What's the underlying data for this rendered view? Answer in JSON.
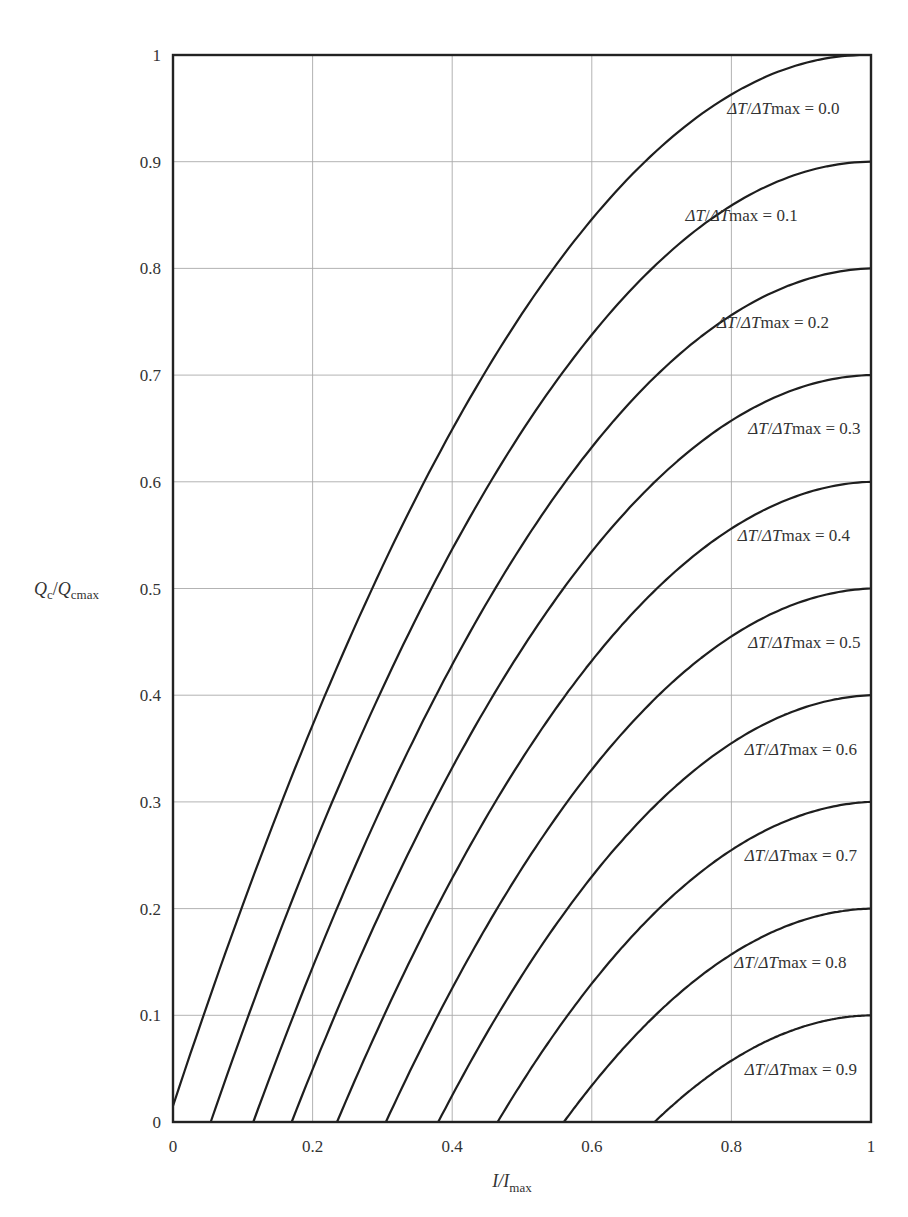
{
  "chart_data": {
    "type": "line",
    "title": "",
    "xlabel": "I/I_max",
    "ylabel": "Q_c/Q_cmax",
    "xlim": [
      0,
      1
    ],
    "ylim": [
      0,
      1
    ],
    "grid": true,
    "legend": "inline labels at right end of each curve",
    "x_ticks": [
      "0",
      "0.2",
      "0.4",
      "0.6",
      "0.8",
      "1"
    ],
    "y_ticks": [
      "0",
      "0.1",
      "0.2",
      "0.3",
      "0.4",
      "0.5",
      "0.6",
      "0.7",
      "0.8",
      "0.9",
      "1"
    ],
    "x": [
      0,
      0.1,
      0.2,
      0.3,
      0.4,
      0.5,
      0.6,
      0.7,
      0.8,
      0.9,
      1.0
    ],
    "series": [
      {
        "name": "ΔT/ΔTmax = 0.0",
        "theta": 0.0,
        "x_intercept": 0.0,
        "values": [
          0.015,
          0.19,
          0.36,
          0.51,
          0.64,
          0.75,
          0.84,
          0.91,
          0.96,
          0.99,
          1.0
        ]
      },
      {
        "name": "ΔT/ΔTmax = 0.1",
        "theta": 0.1,
        "x_intercept": 0.054,
        "values": [
          0,
          0.09,
          0.26,
          0.41,
          0.54,
          0.65,
          0.74,
          0.81,
          0.86,
          0.89,
          0.9
        ]
      },
      {
        "name": "ΔT/ΔTmax = 0.2",
        "theta": 0.2,
        "x_intercept": 0.115,
        "values": [
          0,
          0,
          0.16,
          0.31,
          0.44,
          0.55,
          0.64,
          0.71,
          0.76,
          0.79,
          0.8
        ]
      },
      {
        "name": "ΔT/ΔTmax = 0.3",
        "theta": 0.3,
        "x_intercept": 0.17,
        "values": [
          0,
          0,
          0.06,
          0.21,
          0.34,
          0.45,
          0.54,
          0.61,
          0.66,
          0.69,
          0.7
        ]
      },
      {
        "name": "ΔT/ΔTmax = 0.4",
        "theta": 0.4,
        "x_intercept": 0.235,
        "values": [
          0,
          0,
          0,
          0.11,
          0.24,
          0.35,
          0.44,
          0.51,
          0.56,
          0.59,
          0.6
        ]
      },
      {
        "name": "ΔT/ΔTmax = 0.5",
        "theta": 0.5,
        "x_intercept": 0.305,
        "values": [
          0,
          0,
          0,
          0.01,
          0.14,
          0.25,
          0.34,
          0.41,
          0.46,
          0.49,
          0.5
        ]
      },
      {
        "name": "ΔT/ΔTmax = 0.6",
        "theta": 0.6,
        "x_intercept": 0.38,
        "values": [
          0,
          0,
          0,
          0,
          0.04,
          0.15,
          0.24,
          0.31,
          0.36,
          0.39,
          0.4
        ]
      },
      {
        "name": "ΔT/ΔTmax = 0.7",
        "theta": 0.7,
        "x_intercept": 0.465,
        "values": [
          0,
          0,
          0,
          0,
          0,
          0.05,
          0.14,
          0.21,
          0.26,
          0.29,
          0.3
        ]
      },
      {
        "name": "ΔT/ΔTmax = 0.8",
        "theta": 0.8,
        "x_intercept": 0.56,
        "values": [
          0,
          0,
          0,
          0,
          0,
          0,
          0.04,
          0.11,
          0.16,
          0.19,
          0.2
        ]
      },
      {
        "name": "ΔT/ΔTmax = 0.9",
        "theta": 0.9,
        "x_intercept": 0.69,
        "values": [
          0,
          0,
          0,
          0,
          0,
          0,
          0,
          0.01,
          0.06,
          0.09,
          0.1
        ]
      }
    ],
    "annotations": [
      {
        "text": "ΔT/ΔTmax = 0.0",
        "y": 0.95,
        "x_right": 0.955
      },
      {
        "text": "ΔT/ΔTmax = 0.1",
        "y": 0.85,
        "x_right": 0.895
      },
      {
        "text": "ΔT/ΔTmax = 0.2",
        "y": 0.75,
        "x_right": 0.94
      },
      {
        "text": "ΔT/ΔTmax = 0.3",
        "y": 0.65,
        "x_right": 0.985
      },
      {
        "text": "ΔT/ΔTmax = 0.4",
        "y": 0.55,
        "x_right": 0.97
      },
      {
        "text": "ΔT/ΔTmax = 0.5",
        "y": 0.45,
        "x_right": 0.985
      },
      {
        "text": "ΔT/ΔTmax = 0.6",
        "y": 0.35,
        "x_right": 0.98
      },
      {
        "text": "ΔT/ΔTmax = 0.7",
        "y": 0.25,
        "x_right": 0.98
      },
      {
        "text": "ΔT/ΔTmax = 0.8",
        "y": 0.15,
        "x_right": 0.965
      },
      {
        "text": "ΔT/ΔTmax = 0.9",
        "y": 0.05,
        "x_right": 0.98
      }
    ]
  },
  "labels": {
    "x_axis_main": "I/I",
    "x_axis_sub": "max",
    "y_axis_q1": "Q",
    "y_axis_sub1": "c",
    "y_axis_sep": "/",
    "y_axis_q2": "Q",
    "y_axis_sub2": "cmax",
    "curve_label_prefix_a": "ΔT",
    "curve_label_slash": "/",
    "curve_label_prefix_b": "ΔT",
    "curve_label_suffix": "max = "
  },
  "colors": {
    "curve": "#1e1e1e",
    "grid": "#aaaaaa",
    "frame": "#222222",
    "text": "#333333"
  }
}
